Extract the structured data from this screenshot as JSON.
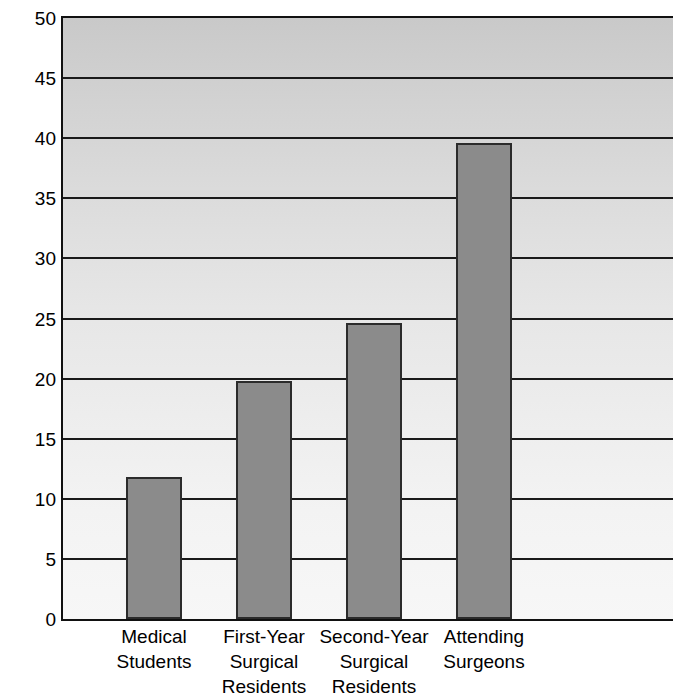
{
  "chart_data": {
    "type": "bar",
    "title": "",
    "xlabel": "",
    "ylabel": "Positive Hepatitis B Serology (%)",
    "categories": [
      "Medical\nStudents",
      "First-Year\nSurgical\nResidents",
      "Second-Year\nSurgical\nResidents",
      "Attending\nSurgeons"
    ],
    "values": [
      11.8,
      19.8,
      24.6,
      39.6
    ],
    "ylim": [
      0,
      50
    ],
    "yticks": [
      0,
      5,
      10,
      15,
      20,
      25,
      30,
      35,
      40,
      45,
      50
    ],
    "ytick_labels": [
      "0",
      "5",
      "10",
      "15",
      "20",
      "25",
      "30",
      "35",
      "40",
      "45",
      "50"
    ],
    "grid": true,
    "grid_axis": "y",
    "legend": null,
    "bar_color": "#8b8b8b",
    "bar_edge_color": "#2b2b2b",
    "gridline_color": "#1a1a1a",
    "plot_background": "vertical gradient from #c9c9c9 (top) to #f7f7f7 (bottom)"
  },
  "figure": {
    "background_color": "#ffffff",
    "axis_color": "#111111"
  }
}
